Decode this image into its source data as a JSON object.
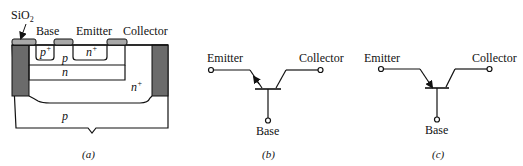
{
  "figure": {
    "panels": [
      {
        "id": "a",
        "caption": "(a)",
        "title": "Lateral pnp transistor cross-section",
        "labels": {
          "oxide": "SiO",
          "oxide_sub": "2",
          "base": "Base",
          "emitter": "Emitter",
          "collector": "Collector",
          "p_plus": "p",
          "p_plus_sup": "+",
          "p_region": "p",
          "n_plus_emitter": "n",
          "n_plus_emitter_sup": "+",
          "n_layer": "n",
          "n_plus_buried": "n",
          "n_plus_buried_sup": "+",
          "p_substrate": "p"
        },
        "colors": {
          "oxide": "#a9a9a9",
          "isolation": "#6b6b6b",
          "line": "#111111"
        }
      },
      {
        "id": "b",
        "caption": "(b)",
        "labels": {
          "emitter": "Emitter",
          "collector": "Collector",
          "base": "Base"
        }
      },
      {
        "id": "c",
        "caption": "(c)",
        "labels": {
          "emitter": "Emitter",
          "collector": "Collector",
          "base": "Base"
        }
      }
    ]
  }
}
